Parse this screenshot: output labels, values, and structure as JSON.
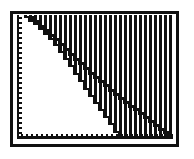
{
  "figure": {
    "colors": {
      "ink": "#101010",
      "paper": "#ffffff"
    },
    "geometry": {
      "canvas": {
        "w": 194,
        "h": 159
      },
      "frame": {
        "x": 11.5,
        "y": 12.5,
        "w": 166,
        "h": 133,
        "stroke": 3.6
      },
      "plot": {
        "left": 14,
        "top": 14.5,
        "right": 175.5,
        "bottom": 143.5
      },
      "stripes": {
        "x0": 24,
        "period": 5,
        "width": 2.7,
        "top": 14.5,
        "bottom": 139,
        "count": 30
      },
      "y_axis": {
        "bar_x": 16.5,
        "bar_w": 2.8,
        "top": 15,
        "bottom": 139,
        "tooth_x": 19.3,
        "tooth_w": 2.5,
        "tooth_h": 2.3,
        "tooth_y0": 17,
        "tooth_period": 5,
        "tooth_last_y": 133
      },
      "x_axis": {
        "bar_y": 135.8,
        "bar_h": 3.1,
        "left": 16.5,
        "right": 172.5,
        "tooth_y": 133.5,
        "tooth_w": 2.3,
        "tooth_h": 2.4,
        "tooth_x0": 21,
        "tooth_period": 5,
        "tooth_last_x": 170
      },
      "curve_a": {
        "points_px": [
          [
            24,
            15
          ],
          [
            38,
            25
          ],
          [
            48,
            35
          ],
          [
            58,
            47
          ],
          [
            68,
            61
          ],
          [
            78,
            76
          ],
          [
            88,
            91
          ],
          [
            100,
            108
          ],
          [
            110,
            122
          ],
          [
            118,
            134
          ],
          [
            121.5,
            138.5
          ]
        ],
        "step_width": 5,
        "thickness": 2.3,
        "white_region_left": 14,
        "white_region_top": 14.5,
        "white_region_bottom": 139.5
      },
      "curve_b": {
        "points_px": [
          [
            29,
            15
          ],
          [
            60,
            43
          ],
          [
            93,
            75
          ],
          [
            130,
            105
          ],
          [
            172,
            137
          ]
        ],
        "step_width": 5,
        "thickness": 3.0
      }
    }
  },
  "chart_data": {
    "type": "line",
    "title": "",
    "xlabel": "",
    "ylabel": "",
    "x_range": [
      0,
      1
    ],
    "y_range": [
      0,
      1
    ],
    "grid": false,
    "legend": false,
    "axes_style": "ruler ticks on left edge and bottom edge, no numeric labels",
    "shading": "vertical line hatching fills plot area except region under curve_boundary; diagonal_line is drawn on top of hatching",
    "series": [
      {
        "name": "curve_boundary",
        "style": "stepped",
        "points": [
          [
            0.054,
            1.0
          ],
          [
            0.141,
            0.919
          ],
          [
            0.205,
            0.838
          ],
          [
            0.269,
            0.741
          ],
          [
            0.333,
            0.628
          ],
          [
            0.397,
            0.506
          ],
          [
            0.462,
            0.385
          ],
          [
            0.538,
            0.247
          ],
          [
            0.603,
            0.134
          ],
          [
            0.654,
            0.036
          ],
          [
            0.676,
            0.0
          ]
        ]
      },
      {
        "name": "diagonal_line",
        "style": "stepped",
        "points": [
          [
            0.083,
            1.0
          ],
          [
            0.282,
            0.773
          ],
          [
            0.494,
            0.514
          ],
          [
            0.731,
            0.271
          ],
          [
            1.0,
            0.012
          ]
        ]
      }
    ]
  }
}
